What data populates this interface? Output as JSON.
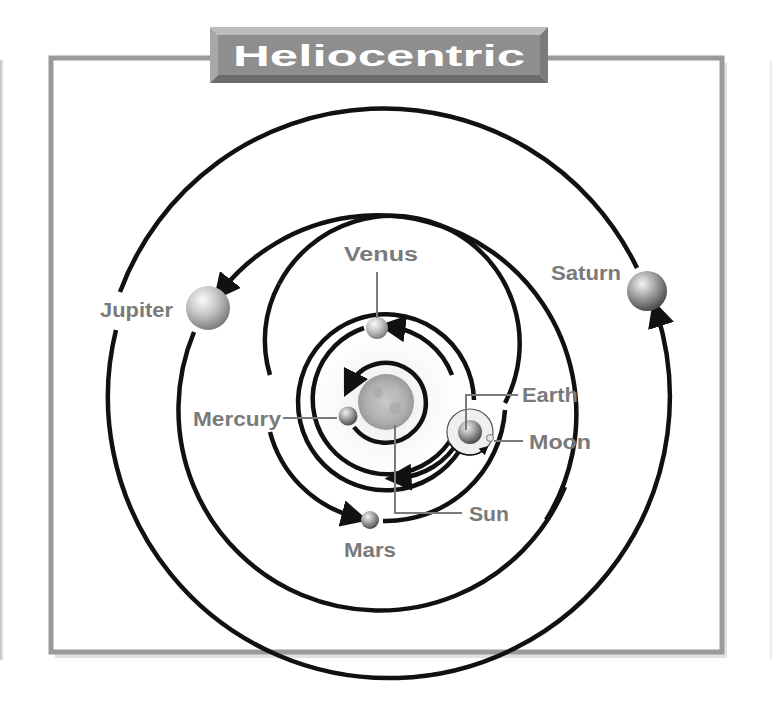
{
  "title": "Heliocentric",
  "colors": {
    "frame": "#9a9a9a",
    "frame_shadow": "#c8c8c8",
    "banner": "#8e8e8e",
    "banner_light": "#b9b9b9",
    "banner_dark": "#6f6f6f",
    "banner_text": "#ffffff",
    "orbit": "#111111",
    "label": "#7a7a7a",
    "leader": "#7a7a7a"
  },
  "center": {
    "x": 386,
    "y": 402
  },
  "sun": {
    "label": "Sun",
    "r": 27
  },
  "bodies": [
    {
      "name": "Mercury",
      "x": 348,
      "y": 416,
      "r": 9
    },
    {
      "name": "Venus",
      "x": 377,
      "y": 328,
      "r": 11
    },
    {
      "name": "Earth",
      "x": 470,
      "y": 432,
      "r": 12
    },
    {
      "name": "Moon",
      "x": 490,
      "y": 438,
      "r": 4
    },
    {
      "name": "Mars",
      "x": 370,
      "y": 520,
      "r": 9
    },
    {
      "name": "Jupiter",
      "x": 208,
      "y": 308,
      "r": 22
    },
    {
      "name": "Saturn",
      "x": 647,
      "y": 291,
      "r": 20
    }
  ],
  "orbits": [
    {
      "name": "Mercury",
      "r": 40
    },
    {
      "name": "Venus",
      "r": 75
    },
    {
      "name": "Earth",
      "r": 88
    },
    {
      "name": "Mars",
      "r": 119
    },
    {
      "name": "Jupiter",
      "r": 199
    },
    {
      "name": "Saturn",
      "r": 281
    },
    {
      "name": "Moon",
      "r": 22
    }
  ],
  "labels": {
    "sun": "Sun",
    "mercury": "Mercury",
    "venus": "Venus",
    "earth": "Earth",
    "moon": "Moon",
    "mars": "Mars",
    "jupiter": "Jupiter",
    "saturn": "Saturn"
  }
}
